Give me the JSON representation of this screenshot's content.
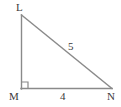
{
  "figure": {
    "type": "right-triangle-geometry-diagram",
    "background_color": "#ffffff",
    "line_color": "#8a8a8a",
    "text_color": "#3a3a3a",
    "vertices": {
      "L": {
        "label": "L",
        "x": 21,
        "y": 15
      },
      "M": {
        "label": "M",
        "x": 21,
        "y": 89
      },
      "N": {
        "label": "N",
        "x": 112,
        "y": 89
      }
    },
    "sides": {
      "hypotenuse": {
        "label": "5",
        "from": "L",
        "to": "N"
      },
      "base": {
        "label": "4",
        "from": "M",
        "to": "N"
      },
      "vertical": {
        "label": "",
        "from": "L",
        "to": "M"
      }
    },
    "right_angle": {
      "at_vertex": "M",
      "marker": "square",
      "size": 7
    }
  }
}
